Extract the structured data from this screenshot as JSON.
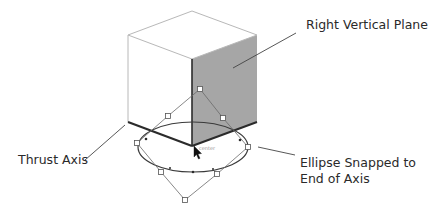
{
  "labels": {
    "right_vertical_plane": "Right Vertical Plane",
    "thrust_axis": "Thrust Axis",
    "ellipse_line1": "Ellipse Snapped to",
    "ellipse_line2": "End of Axis"
  },
  "colors": {
    "background": "#ffffff",
    "cube_light_edge": "#b8b8b8",
    "cube_dark_edge": "#2b2b2b",
    "right_face_fill": "#a6a6a6",
    "ellipse_stroke": "#3a3a3a",
    "handle_stroke": "#555555",
    "leader_line": "#444444",
    "text": "#2a2a2a"
  }
}
